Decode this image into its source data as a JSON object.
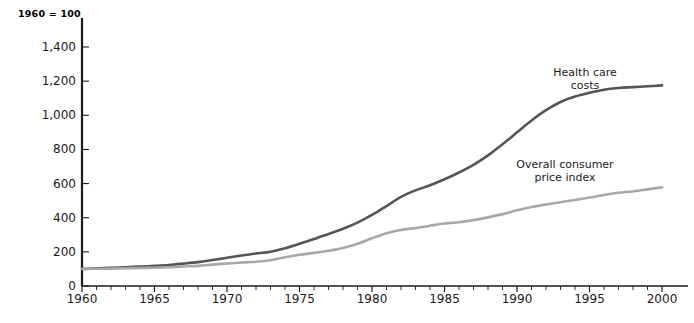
{
  "chart_data": {
    "type": "line",
    "title": "",
    "subtitle": "",
    "axis_note": "1960 = 100",
    "xlabel": "",
    "ylabel": "",
    "xlim": [
      1960,
      2000
    ],
    "ylim": [
      0,
      1500
    ],
    "grid": false,
    "legend_position": "inline-annotation",
    "y_ticks": [
      0,
      200,
      400,
      600,
      800,
      1000,
      1200,
      1400
    ],
    "y_tick_labels": [
      "0",
      "200",
      "400",
      "600",
      "800",
      "1,000",
      "1,200",
      "1,400"
    ],
    "x_ticks": [
      1960,
      1965,
      1970,
      1975,
      1980,
      1985,
      1990,
      1995,
      2000
    ],
    "x_tick_labels": [
      "1960",
      "1965",
      "1970",
      "1975",
      "1980",
      "1985",
      "1990",
      "1995",
      "2000"
    ],
    "x_minor_tick_interval": 1,
    "x": [
      1960,
      1961,
      1962,
      1963,
      1964,
      1965,
      1966,
      1967,
      1968,
      1969,
      1970,
      1971,
      1972,
      1973,
      1974,
      1975,
      1976,
      1977,
      1978,
      1979,
      1980,
      1981,
      1982,
      1983,
      1984,
      1985,
      1986,
      1987,
      1988,
      1989,
      1990,
      1991,
      1992,
      1993,
      1994,
      1995,
      1996,
      1997,
      1998,
      1999,
      2000
    ],
    "series": [
      {
        "name": "Health care costs",
        "color": "#555555",
        "label_line1": "Health care",
        "label_line2": "costs",
        "values": [
          100,
          103,
          106,
          110,
          114,
          118,
          123,
          131,
          140,
          152,
          166,
          179,
          190,
          201,
          221,
          247,
          275,
          305,
          335,
          371,
          416,
          468,
          522,
          560,
          590,
          625,
          665,
          710,
          765,
          830,
          900,
          970,
          1030,
          1078,
          1110,
          1132,
          1150,
          1160,
          1165,
          1170,
          1175
        ]
      },
      {
        "name": "Overall consumer price index",
        "color": "#a8a8a8",
        "label_line1": "Overall consumer",
        "label_line2": "price index",
        "values": [
          100,
          101,
          102,
          104,
          105,
          107,
          110,
          114,
          118,
          125,
          132,
          138,
          142,
          151,
          168,
          183,
          194,
          206,
          222,
          247,
          280,
          309,
          328,
          339,
          353,
          366,
          373,
          386,
          402,
          421,
          444,
          463,
          477,
          491,
          504,
          518,
          533,
          546,
          554,
          566,
          578
        ]
      }
    ],
    "colors": {
      "axis": "#1a1a1a",
      "background": "#ffffff",
      "health_care": "#555555",
      "cpi": "#a8a8a8"
    }
  }
}
